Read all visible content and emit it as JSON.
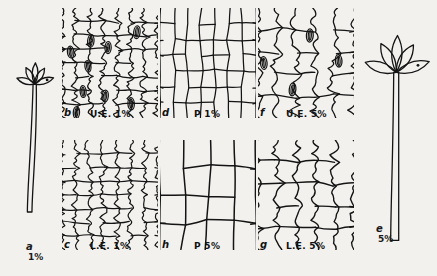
{
  "plate": {
    "title": "Leaf epidermis and habit comparison plate",
    "background_color": "#f2f1ee",
    "ink_color": "#141414",
    "width": 437,
    "height": 276
  },
  "habits": [
    {
      "id": "a",
      "letter": "a",
      "concentration": "1%",
      "name": "whole-plant-habit-low",
      "x": 8,
      "y": 46,
      "w": 58,
      "h": 190,
      "stem_top_w": 3.2,
      "stem_bottom_w": 4.6,
      "stem_len": 128,
      "leaf_scale": 1.0,
      "leaves": 5,
      "label_x": 18,
      "label_y": 196
    },
    {
      "id": "e",
      "letter": "e",
      "concentration": "5%",
      "name": "whole-plant-habit-high",
      "x": 364,
      "y": 28,
      "w": 70,
      "h": 222,
      "stem_top_w": 5.0,
      "stem_bottom_w": 8.0,
      "stem_len": 168,
      "leaf_scale": 1.75,
      "leaves": 5,
      "label_x": 12,
      "label_y": 196
    }
  ],
  "panels": [
    {
      "id": "b",
      "letter": "b",
      "tissue_code": "U.E.",
      "tissue_name": "upper epidermis",
      "concentration": "1%",
      "caption": "U.E. 1%",
      "name": "panel-b-upper-epidermis-1pct",
      "x": 62,
      "y": 8,
      "w": 96,
      "h": 110,
      "wall": "sinuous",
      "cols": 7,
      "rows": 8,
      "waviness": 3.4,
      "stroke": 1.25,
      "stomata": [
        {
          "cx": 0.09,
          "cy": 0.4,
          "rx": 3.2,
          "ry": 6.0,
          "rot": -6
        },
        {
          "cx": 0.3,
          "cy": 0.3,
          "rx": 3.2,
          "ry": 6.2,
          "rot": 4
        },
        {
          "cx": 0.27,
          "cy": 0.53,
          "rx": 3.0,
          "ry": 5.8,
          "rot": -8
        },
        {
          "cx": 0.48,
          "cy": 0.36,
          "rx": 3.1,
          "ry": 6.0,
          "rot": 2
        },
        {
          "cx": 0.78,
          "cy": 0.22,
          "rx": 3.2,
          "ry": 6.4,
          "rot": 6
        },
        {
          "cx": 0.22,
          "cy": 0.76,
          "rx": 3.0,
          "ry": 5.9,
          "rot": -4
        },
        {
          "cx": 0.45,
          "cy": 0.8,
          "rx": 3.1,
          "ry": 6.0,
          "rot": 5
        },
        {
          "cx": 0.72,
          "cy": 0.87,
          "rx": 3.2,
          "ry": 6.2,
          "rot": -3
        },
        {
          "cx": 0.15,
          "cy": 0.95,
          "rx": 3.1,
          "ry": 6.0,
          "rot": 3
        }
      ],
      "label_letter_x": 2,
      "label_letter_y": 100,
      "label_cap_x": 28,
      "label_cap_y": 102
    },
    {
      "id": "d",
      "letter": "d",
      "tissue_code": "P",
      "tissue_name": "palisade",
      "concentration": "1%",
      "caption": "P 1%",
      "name": "panel-d-palisade-1pct",
      "x": 160,
      "y": 8,
      "w": 96,
      "h": 110,
      "wall": "straight",
      "cols": 7,
      "rows": 7,
      "waviness": 0.5,
      "stroke": 1.25,
      "stomata": [],
      "label_letter_x": 2,
      "label_letter_y": 100,
      "label_cap_x": 34,
      "label_cap_y": 102
    },
    {
      "id": "f",
      "letter": "f",
      "tissue_code": "U.E.",
      "tissue_name": "upper epidermis",
      "concentration": "5%",
      "caption": "U.E. 5%",
      "name": "panel-f-upper-epidermis-5pct",
      "x": 258,
      "y": 8,
      "w": 96,
      "h": 110,
      "wall": "sinuous",
      "cols": 5,
      "rows": 5,
      "waviness": 4.6,
      "stroke": 1.3,
      "stomata": [
        {
          "cx": 0.06,
          "cy": 0.5,
          "rx": 3.3,
          "ry": 6.4,
          "rot": -5
        },
        {
          "cx": 0.54,
          "cy": 0.25,
          "rx": 3.4,
          "ry": 6.6,
          "rot": 3
        },
        {
          "cx": 0.84,
          "cy": 0.48,
          "rx": 3.3,
          "ry": 6.2,
          "rot": -4
        },
        {
          "cx": 0.36,
          "cy": 0.74,
          "rx": 3.3,
          "ry": 6.4,
          "rot": 6
        }
      ],
      "label_letter_x": 2,
      "label_letter_y": 100,
      "label_cap_x": 28,
      "label_cap_y": 102
    },
    {
      "id": "c",
      "letter": "c",
      "tissue_code": "L.E.",
      "tissue_name": "lower epidermis",
      "concentration": "1%",
      "caption": "L.E. 1%",
      "name": "panel-c-lower-epidermis-1pct",
      "x": 62,
      "y": 140,
      "w": 96,
      "h": 110,
      "wall": "sinuous",
      "cols": 7,
      "rows": 8,
      "waviness": 3.0,
      "stroke": 1.2,
      "stomata": [],
      "label_letter_x": 2,
      "label_letter_y": 100,
      "label_cap_x": 28,
      "label_cap_y": 102
    },
    {
      "id": "h",
      "letter": "h",
      "tissue_code": "P",
      "tissue_name": "palisade",
      "concentration": "5%",
      "caption": "P 5%",
      "name": "panel-h-palisade-5pct",
      "x": 160,
      "y": 140,
      "w": 96,
      "h": 110,
      "wall": "straight",
      "cols": 4,
      "rows": 4,
      "waviness": 0.6,
      "stroke": 1.5,
      "stomata": [],
      "label_letter_x": 2,
      "label_letter_y": 100,
      "label_cap_x": 34,
      "label_cap_y": 102
    },
    {
      "id": "g",
      "letter": "g",
      "tissue_code": "L.E.",
      "tissue_name": "lower epidermis",
      "concentration": "5%",
      "caption": "L.E. 5%",
      "name": "panel-g-lower-epidermis-5pct",
      "x": 258,
      "y": 140,
      "w": 96,
      "h": 110,
      "wall": "sinuous",
      "cols": 5,
      "rows": 5,
      "waviness": 4.2,
      "stroke": 1.4,
      "stomata": [],
      "label_letter_x": 2,
      "label_letter_y": 100,
      "label_cap_x": 28,
      "label_cap_y": 102
    }
  ]
}
